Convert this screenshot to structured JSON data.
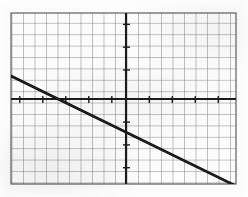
{
  "figure": {
    "kind": "graph-paper-line-plot",
    "background_color": "#fbfbfb",
    "grid_color": "#6e6e6e",
    "grid_minor_color": "#8d8d8d",
    "axis_color": "#1a1a1a",
    "line_color": "#111111"
  },
  "chart_data": {
    "type": "line",
    "title": "",
    "subtitle": "",
    "xlabel": "",
    "ylabel": "",
    "grid": true,
    "grid_spacing_px": 11.5,
    "legend": "none",
    "annotations": [],
    "plot_box_px": {
      "left": 11,
      "top": 13,
      "right": 236,
      "bottom": 184
    },
    "axes_px": {
      "x_axis_y": 99,
      "y_axis_x": 126
    },
    "grid_counts": {
      "columns": 20,
      "rows": 15
    },
    "axis_origin_cell": {
      "col_from_left": 10,
      "row_from_top": 7.5
    },
    "xlim": [
      -10,
      10
    ],
    "ylim": [
      -7.5,
      7.5
    ],
    "xticks": [
      -10,
      -9,
      -8,
      -7,
      -6,
      -5,
      -4,
      -3,
      -2,
      -1,
      0,
      1,
      2,
      3,
      4,
      5,
      6,
      7,
      8,
      9,
      10
    ],
    "yticks": [
      -7,
      -6,
      -5,
      -4,
      -3,
      -2,
      -1,
      0,
      1,
      2,
      3,
      4,
      5,
      6,
      7
    ],
    "tick_labels_visible": false,
    "series": [
      {
        "name": "drawn-line",
        "slope": -0.5,
        "y_intercept": -2.7,
        "x_intercept": -5.1,
        "endpoints_px": [
          {
            "x": 11,
            "y": 76
          },
          {
            "x": 236,
            "y": 186
          }
        ],
        "endpoints_data": [
          {
            "x": -10,
            "y": 2.0
          },
          {
            "x": 10,
            "y": -7.6
          }
        ],
        "x": [
          -10,
          -5.1,
          0,
          10
        ],
        "values": [
          2.0,
          0.0,
          -2.7,
          -7.6
        ],
        "stroke_width_px": 2.6
      }
    ]
  }
}
